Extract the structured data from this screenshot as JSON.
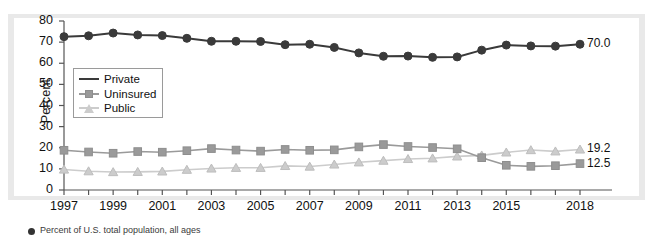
{
  "axis": {
    "ylabel": "Percent",
    "yticks": [
      "0",
      "10",
      "20",
      "30",
      "40",
      "50",
      "60",
      "70",
      "80"
    ],
    "xticks": [
      "1997",
      "1999",
      "2001",
      "2003",
      "2005",
      "2007",
      "2009",
      "2011",
      "2013",
      "2015",
      "2018"
    ]
  },
  "legend": {
    "items": [
      {
        "label": "Private",
        "marker": "circle",
        "color": "#3a3a3a"
      },
      {
        "label": "Uninsured",
        "marker": "square",
        "color": "#9a9a9a"
      },
      {
        "label": "Public",
        "marker": "triangle",
        "color": "#cccccc"
      }
    ]
  },
  "end_labels": {
    "private": "70.0",
    "public": "19.2",
    "uninsured": "12.5"
  },
  "caption": {
    "text": "Percent of U.S. total population, all ages"
  },
  "chart_data": {
    "type": "line",
    "title": "",
    "xlabel": "",
    "ylabel": "Percent",
    "ylim": [
      0,
      80
    ],
    "xlim": [
      1997,
      2018
    ],
    "grid": false,
    "legend_position": "inside-left",
    "x": [
      1997,
      1998,
      1999,
      2000,
      2001,
      2002,
      2003,
      2004,
      2005,
      2006,
      2007,
      2008,
      2009,
      2010,
      2011,
      2012,
      2013,
      2014,
      2015,
      2016,
      2017,
      2018
    ],
    "series": [
      {
        "name": "Private",
        "color": "#3a3a3a",
        "marker": "circle",
        "end_label": "70.0",
        "values": [
          72.6,
          73.0,
          74.3,
          73.4,
          73.1,
          71.8,
          70.4,
          70.4,
          70.3,
          68.8,
          69.0,
          67.5,
          64.9,
          63.3,
          63.4,
          62.8,
          63.0,
          66.2,
          68.6,
          68.2,
          68.1,
          69.0
        ]
      },
      {
        "name": "Uninsured",
        "color": "#9a9a9a",
        "marker": "square",
        "end_label": "12.5",
        "values": [
          18.8,
          18.0,
          17.4,
          18.2,
          17.9,
          18.6,
          19.6,
          18.9,
          18.4,
          19.2,
          18.8,
          19.0,
          20.4,
          21.5,
          20.6,
          20.1,
          19.5,
          15.3,
          11.7,
          11.2,
          11.5,
          12.5
        ]
      },
      {
        "name": "Public",
        "color": "#cccccc",
        "marker": "triangle",
        "end_label": "19.2",
        "values": [
          9.7,
          8.9,
          8.5,
          8.6,
          8.8,
          9.6,
          10.2,
          10.5,
          10.5,
          11.4,
          11.1,
          12.1,
          13.1,
          13.9,
          14.7,
          15.0,
          15.9,
          16.4,
          17.8,
          18.9,
          18.3,
          19.2
        ]
      }
    ]
  }
}
